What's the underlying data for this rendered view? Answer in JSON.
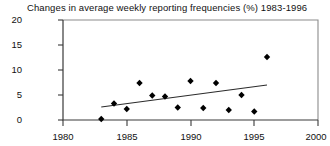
{
  "chart_data": {
    "type": "scatter",
    "title": "Changes in average weekly reporting frequencies (%) 1983-1996",
    "xlabel": "",
    "ylabel": "",
    "xlim": [
      1980,
      2000
    ],
    "ylim": [
      0,
      20
    ],
    "grid": false,
    "legend": null,
    "xticks": [
      1980,
      1985,
      1990,
      1995,
      2000
    ],
    "yticks": [
      0,
      5,
      10,
      15,
      20
    ],
    "x": [
      1983,
      1984,
      1985,
      1986,
      1987,
      1988,
      1989,
      1990,
      1991,
      1992,
      1993,
      1994,
      1995,
      1996
    ],
    "values": [
      0.2,
      3.3,
      2.2,
      7.4,
      4.9,
      4.7,
      2.5,
      7.8,
      2.4,
      7.4,
      2.0,
      5.0,
      1.7,
      12.6
    ],
    "series": [
      {
        "name": "Reporting frequency change",
        "marker": "diamond",
        "values": [
          0.2,
          3.3,
          2.2,
          7.4,
          4.9,
          4.7,
          2.5,
          7.8,
          2.4,
          7.4,
          2.0,
          5.0,
          1.7,
          12.6
        ]
      }
    ],
    "trendline": {
      "type": "linear",
      "x_start": 1983,
      "y_start": 2.6,
      "x_end": 1996,
      "y_end": 7.0
    }
  },
  "axes": {
    "y_tick_labels": [
      "20",
      "15",
      "10",
      "5",
      "0"
    ],
    "x_tick_labels": [
      "1980",
      "1985",
      "1990",
      "1995",
      "2000"
    ]
  }
}
